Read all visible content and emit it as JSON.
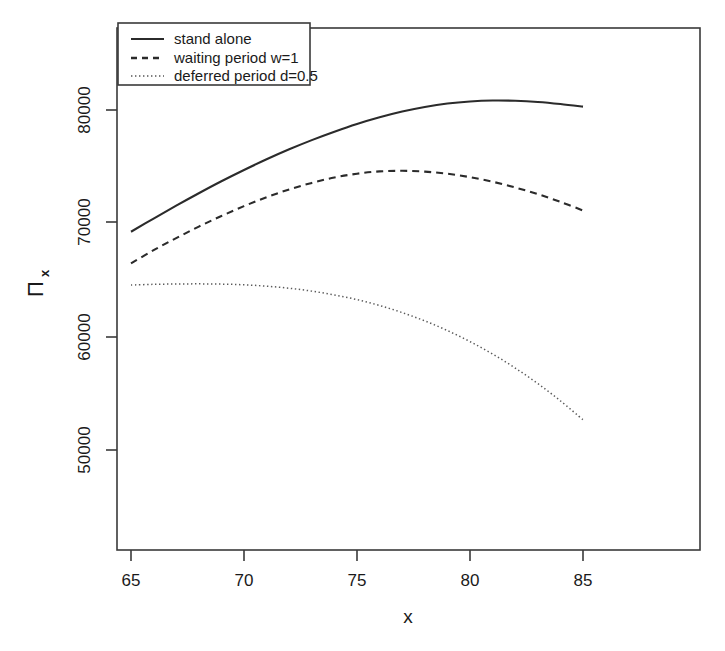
{
  "chart_data": {
    "type": "line",
    "title": "",
    "subtitle": "",
    "xlabel": "x",
    "ylabel": "Π",
    "ylabel_sub": "x",
    "xlim": [
      65,
      85
    ],
    "ylim": [
      46000,
      82600
    ],
    "grid": false,
    "legend_position": "top-left",
    "xticks": [
      65,
      70,
      75,
      80,
      85
    ],
    "xtick_labels": [
      "65",
      "70",
      "75",
      "80",
      "85"
    ],
    "yticks": [
      50000,
      60000,
      70000,
      80000
    ],
    "ytick_labels": [
      "50000",
      "60000",
      "70000",
      "80000"
    ],
    "x": [
      65,
      66,
      67,
      68,
      69,
      70,
      71,
      72,
      73,
      74,
      75,
      76,
      77,
      78,
      79,
      80,
      81,
      82,
      83,
      84,
      85
    ],
    "series": [
      {
        "name": "stand alone",
        "linestyle": "solid",
        "color": "#2b2b2b",
        "values": [
          69150,
          70300,
          71420,
          72500,
          73540,
          74520,
          75450,
          76320,
          77120,
          77850,
          78520,
          79100,
          79600,
          80000,
          80300,
          80480,
          80560,
          80540,
          80440,
          80260,
          80030
        ]
      },
      {
        "name": "waiting period w=1",
        "linestyle": "dashed",
        "color": "#2b2b2b",
        "values": [
          66400,
          67550,
          68600,
          69600,
          70520,
          71380,
          72150,
          72830,
          73400,
          73870,
          74200,
          74400,
          74450,
          74380,
          74200,
          73900,
          73500,
          73000,
          72420,
          71750,
          71000
        ]
      },
      {
        "name": "deferred period d=0.5",
        "linestyle": "dotted",
        "color": "#2b2b2b",
        "values": [
          64520,
          64580,
          64610,
          64620,
          64600,
          64540,
          64420,
          64240,
          63990,
          63660,
          63250,
          62740,
          62120,
          61400,
          60560,
          59600,
          58520,
          57300,
          55950,
          54450,
          52800
        ]
      }
    ]
  },
  "legend": {
    "items": [
      {
        "label": "stand alone",
        "key": "solid-line-key"
      },
      {
        "label": "waiting period w=1",
        "key": "dashed-line-key"
      },
      {
        "label": "deferred period d=0.5",
        "key": "dotted-line-key"
      }
    ]
  },
  "colors": {
    "background": "#ffffff",
    "axis": "#3a3a3a",
    "line": "#2b2b2b"
  }
}
